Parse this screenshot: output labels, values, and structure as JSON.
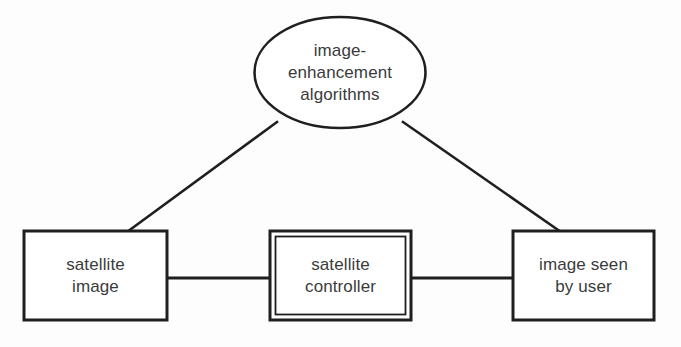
{
  "diagram": {
    "type": "context-diagram",
    "background_color": "#fdfdfd",
    "stroke_color": "#1f1f1f",
    "text_color": "#3b3b3b",
    "nodes": {
      "ellipse": {
        "shape": "ellipse",
        "lines": [
          "image-",
          "enhancement",
          "algorithms"
        ],
        "full_text": "image-enhancement algorithms"
      },
      "box_left": {
        "shape": "rectangle",
        "lines": [
          "satellite",
          "image"
        ],
        "full_text": "satellite image"
      },
      "box_center": {
        "shape": "double-rectangle",
        "lines": [
          "satellite",
          "controller"
        ],
        "full_text": "satellite controller"
      },
      "box_right": {
        "shape": "rectangle",
        "lines": [
          "image seen",
          "by user"
        ],
        "full_text": "image seen by user"
      }
    },
    "connectors": [
      {
        "name": "ellipse-to-satellite-image",
        "style": "diagonal-line"
      },
      {
        "name": "ellipse-to-image-seen-by-user",
        "style": "diagonal-line"
      },
      {
        "name": "satellite-image-to-satellite-controller",
        "style": "horizontal-line"
      },
      {
        "name": "satellite-controller-to-image-seen-by-user",
        "style": "horizontal-line"
      }
    ]
  }
}
